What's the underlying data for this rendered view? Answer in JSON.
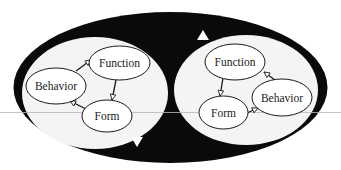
{
  "diagram": {
    "title": "",
    "colors": {
      "background": "#ffffff",
      "outer_ring": "#0a0a0a",
      "panel_fill": "#f4f4f4",
      "node_fill": "#ffffff",
      "node_stroke": "#1a1a1a",
      "scan_line": "#b8b8b8"
    },
    "outer_cycle": {
      "shape": "ellipse",
      "direction_markers": [
        {
          "position": "top",
          "pointing": "up"
        },
        {
          "position": "bottom",
          "pointing": "down"
        }
      ]
    },
    "panels": [
      {
        "id": "left",
        "nodes": [
          {
            "id": "function",
            "label": "Function"
          },
          {
            "id": "behavior",
            "label": "Behavior"
          },
          {
            "id": "form",
            "label": "Form"
          }
        ],
        "edges": [
          {
            "from": "behavior",
            "to": "function"
          },
          {
            "from": "function",
            "to": "form"
          },
          {
            "from": "form",
            "to": "behavior"
          }
        ]
      },
      {
        "id": "right",
        "nodes": [
          {
            "id": "function",
            "label": "Function"
          },
          {
            "id": "behavior",
            "label": "Behavior"
          },
          {
            "id": "form",
            "label": "Form"
          }
        ],
        "edges": [
          {
            "from": "function",
            "to": "form"
          },
          {
            "from": "form",
            "to": "behavior"
          },
          {
            "from": "behavior",
            "to": "function"
          }
        ]
      }
    ]
  }
}
